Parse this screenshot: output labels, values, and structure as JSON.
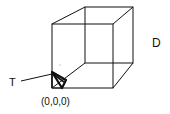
{
  "diagram": {
    "type": "3d-cube-wireframe",
    "labels": {
      "tetrahedron": "T",
      "domain": "D",
      "origin": "(0,0,0)"
    },
    "colors": {
      "line": "#111111",
      "background": "#ffffff"
    }
  }
}
